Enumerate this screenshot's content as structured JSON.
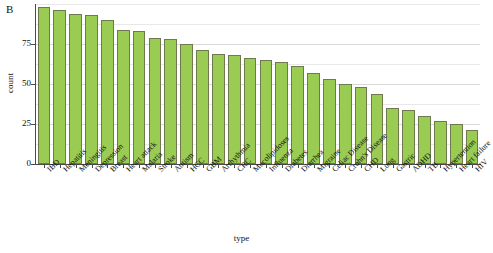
{
  "panel": {
    "label": "B"
  },
  "axes": {
    "x_title": "type",
    "y_title": "count",
    "y_ticks": [
      "0",
      "25",
      "50",
      "75"
    ]
  },
  "style": {
    "bar_fill": "#9ACB52",
    "bar_stroke": "#6e7a4e",
    "grid_color": "#d9d9d9",
    "axis_color": "#4a4a4a"
  },
  "chart_data": {
    "type": "bar",
    "title": "",
    "subtitle": "",
    "xlabel": "type",
    "ylabel": "count",
    "ylim": [
      0,
      100
    ],
    "xlim": null,
    "grid": true,
    "legend": null,
    "orientation": "vertical",
    "sorted": "descending",
    "categories": [
      "IBD",
      "Hepatitis",
      "Meningitis",
      "Depression",
      "Breast",
      "Heart attack",
      "Malaria",
      "Stroke",
      "Autism",
      "HCC",
      "GBM",
      "Arrhythmia",
      "CRC",
      "Mucolipidoses",
      "Influenza",
      "Diabetes",
      "Diarrhea",
      "Migraine",
      "Celiac Disease",
      "Crohn's Disease",
      "CHD",
      "Lung",
      "Gastric",
      "ADHD",
      "TB",
      "Hypertention",
      "Heart failure",
      "HIV"
    ],
    "values": [
      98,
      96,
      94,
      93,
      90,
      84,
      83,
      79,
      78,
      75,
      71,
      69,
      68,
      66,
      65,
      64,
      61,
      57,
      53,
      50,
      48,
      44,
      35,
      34,
      30,
      27,
      25,
      21
    ],
    "yticks": [
      0,
      25,
      50,
      75
    ]
  }
}
